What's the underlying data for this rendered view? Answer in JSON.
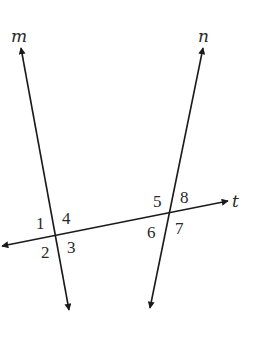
{
  "diagram": {
    "type": "parallel-lines-with-transversal",
    "lines": [
      {
        "id": "m",
        "label": "m",
        "x1": 69,
        "y1": 310,
        "x2": 21,
        "y2": 48,
        "label_x": 11,
        "label_y": 42
      },
      {
        "id": "n",
        "label": "n",
        "x1": 150,
        "y1": 308,
        "x2": 203,
        "y2": 48,
        "label_x": 198,
        "label_y": 42
      },
      {
        "id": "t",
        "label": "t",
        "x1": 228,
        "y1": 201,
        "x2": 2,
        "y2": 246,
        "label_x": 232,
        "label_y": 207
      }
    ],
    "intersections": [
      {
        "lines": [
          "m",
          "t"
        ],
        "x": 57,
        "y": 234
      },
      {
        "lines": [
          "n",
          "t"
        ],
        "x": 170,
        "y": 211
      }
    ],
    "angle_labels": [
      {
        "text": "1",
        "x": 36,
        "y": 229
      },
      {
        "text": "4",
        "x": 62,
        "y": 224
      },
      {
        "text": "2",
        "x": 41,
        "y": 258
      },
      {
        "text": "3",
        "x": 67,
        "y": 253
      },
      {
        "text": "5",
        "x": 153,
        "y": 207
      },
      {
        "text": "8",
        "x": 180,
        "y": 203
      },
      {
        "text": "6",
        "x": 147,
        "y": 238
      },
      {
        "text": "7",
        "x": 175,
        "y": 234
      }
    ],
    "color": "#1a1a1a"
  }
}
